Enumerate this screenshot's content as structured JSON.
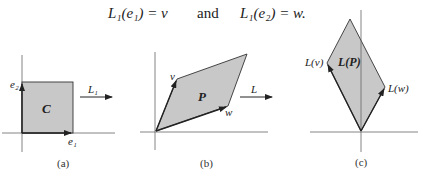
{
  "equation": {
    "left": "L₁(e₁) = v",
    "connector": "and",
    "right": "L₁(e₂) = w."
  },
  "panels": [
    {
      "caption": "(a)",
      "region_label": "C",
      "vector_labels": [
        "e₂",
        "e₁"
      ],
      "map_label": "L₁"
    },
    {
      "caption": "(b)",
      "region_label": "P",
      "vector_labels": [
        "v",
        "w"
      ],
      "map_label": "L"
    },
    {
      "caption": "(c)",
      "region_label": "L(P)",
      "vector_labels": [
        "L(v)",
        "L(w)"
      ]
    }
  ],
  "colors": {
    "fill": "#c8c8c8",
    "stroke": "#333333",
    "axis": "#666666"
  }
}
